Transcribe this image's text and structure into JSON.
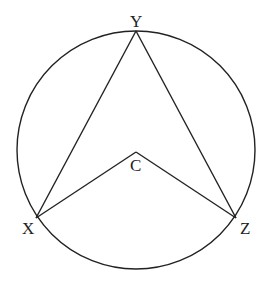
{
  "diagram": {
    "type": "circle-geometry",
    "points": {
      "Y": {
        "label": "Y",
        "on_circle": true
      },
      "X": {
        "label": "X",
        "on_circle": true
      },
      "Z": {
        "label": "Z",
        "on_circle": true
      },
      "C": {
        "label": "C",
        "center": true
      }
    },
    "segments": [
      {
        "from": "Y",
        "to": "X"
      },
      {
        "from": "Y",
        "to": "Z"
      },
      {
        "from": "C",
        "to": "X"
      },
      {
        "from": "C",
        "to": "Z"
      }
    ],
    "stroke_color": "#222222"
  }
}
